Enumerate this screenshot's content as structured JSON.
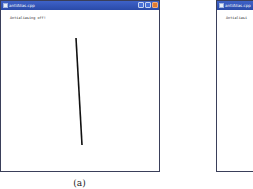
{
  "figure": {
    "caption": "(a)"
  },
  "windows": [
    {
      "title": "antiAlias.cpp",
      "content_text": "Antialiasing off!",
      "line": {
        "x1": 76,
        "y1": 38,
        "x2": 82,
        "y2": 145,
        "color": "#111111"
      },
      "controls": [
        "minimize",
        "maximize",
        "close"
      ]
    },
    {
      "title": "antiAlias.cpp",
      "content_text": "Antialiasi"
    }
  ]
}
